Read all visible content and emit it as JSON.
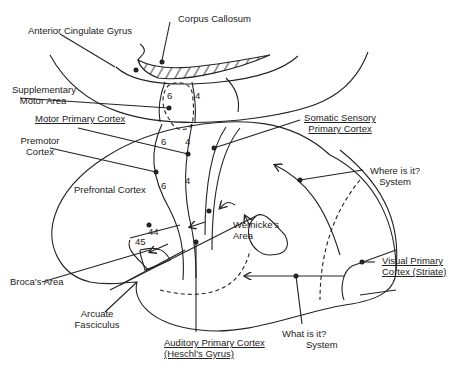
{
  "diagram": {
    "type": "brain-lateral-view",
    "labels": {
      "corpus_callosum": "Corpus Callosum",
      "anterior_cingulate": "Anterior Cingulate Gyrus",
      "supplementary_motor_1": "Supplementary",
      "supplementary_motor_2": "Motor Area",
      "motor_primary": "Motor Primary Cortex",
      "somatic_sensory_1": "Somatic Sensory",
      "somatic_sensory_2": "Primary Cortex",
      "premotor_1": "Premotor",
      "premotor_2": "Cortex",
      "prefrontal": "Prefrontal Cortex",
      "where_1": "Where is it?",
      "where_2": "System",
      "wernicke_1": "Wernicke's",
      "wernicke_2": "Area",
      "brocas": "Broca's Area",
      "arcuate_1": "Arcuate",
      "arcuate_2": "Fasciculus",
      "auditory_1": "Auditory Primary Cortex",
      "auditory_2": "(Heschl's Gyrus)",
      "visual_1": "Visual Primary",
      "visual_2": "Cortex (Striate)",
      "what_1": "What is it?",
      "what_2": "System"
    },
    "area_numbers": {
      "sma_6": "6",
      "sma_4": "4",
      "upper_6": "6",
      "upper_4": "4",
      "lower_6": "6",
      "lower_4": "4",
      "b44": "44",
      "b45": "45"
    }
  }
}
